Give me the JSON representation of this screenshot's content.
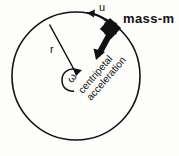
{
  "diagram": {
    "background_color": "#fdfdfb",
    "stroke_color": "#111111",
    "labels": {
      "tangential_velocity": "u",
      "mass": "mass-m",
      "radius": "r",
      "angular_velocity": "ω",
      "centripetal_line1": "centripetal",
      "centripetal_line2": "acceleration"
    },
    "icons": {
      "mass_marker": "filled-square-mass-icon",
      "velocity_arrow": "tangential-arrow-icon",
      "acceleration_arrow": "centripetal-arrow-icon",
      "rotation_arrow": "curved-rotation-arrow-icon"
    }
  }
}
